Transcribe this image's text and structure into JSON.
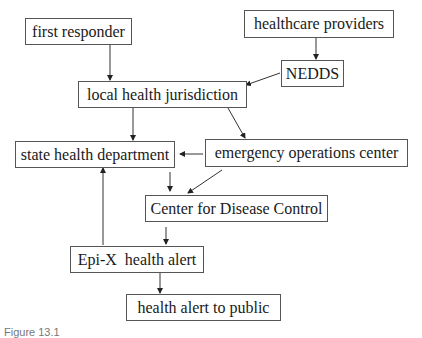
{
  "diagram": {
    "type": "flowchart",
    "nodes": {
      "first_responder": "first responder",
      "healthcare_providers": "healthcare providers",
      "nedds": "NEDDS",
      "local_health_jurisdiction": "local health jurisdiction",
      "state_health_department": "state health department",
      "emergency_operations_center": "emergency operations center",
      "center_for_disease_control": "Center for Disease Control",
      "epi_x_health_alert": "Epi-X  health alert",
      "health_alert_to_public": "health alert to public"
    },
    "edges": [
      {
        "from": "first responder",
        "to": "local health jurisdiction"
      },
      {
        "from": "healthcare providers",
        "to": "NEDDS"
      },
      {
        "from": "NEDDS",
        "to": "local health jurisdiction"
      },
      {
        "from": "local health jurisdiction",
        "to": "state health department"
      },
      {
        "from": "local health jurisdiction",
        "to": "emergency operations center"
      },
      {
        "from": "emergency operations center",
        "to": "state health department"
      },
      {
        "from": "state health department",
        "to": "Center for Disease Control"
      },
      {
        "from": "emergency operations center",
        "to": "Center for Disease Control"
      },
      {
        "from": "Center for Disease Control",
        "to": "Epi-X health alert"
      },
      {
        "from": "Epi-X health alert",
        "to": "state health department"
      },
      {
        "from": "Epi-X health alert",
        "to": "health alert to public"
      }
    ],
    "caption": "Figure 13.1"
  }
}
